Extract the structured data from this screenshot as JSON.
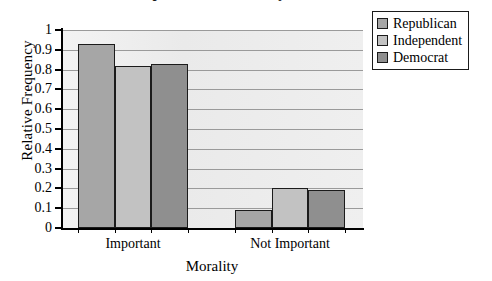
{
  "chart_data": {
    "type": "bar",
    "title": "Importance of Morality",
    "xlabel": "Morality",
    "ylabel": "Relative Frequency",
    "categories": [
      "Important",
      "Not Important"
    ],
    "series": [
      {
        "name": "Republican",
        "values": [
          0.93,
          0.09
        ],
        "color": "#a6a6a6"
      },
      {
        "name": "Independent",
        "values": [
          0.82,
          0.2
        ],
        "color": "#c2c2c2"
      },
      {
        "name": "Democrat",
        "values": [
          0.83,
          0.19
        ],
        "color": "#8f8f8f"
      }
    ],
    "ylim": [
      0,
      1
    ],
    "ytick_labels": [
      "1",
      "0.9",
      "0.8",
      "0.7",
      "0.6",
      "0.5",
      "0.4",
      "0.3",
      "0.2",
      "0.1",
      "0"
    ],
    "ytick_values": [
      1,
      0.9,
      0.8,
      0.7,
      0.6,
      0.5,
      0.4,
      0.3,
      0.2,
      0.1,
      0
    ],
    "grid": true,
    "legend_position": "top-right",
    "plot_background": "#ececec",
    "gridline_color": "#9a9a9a",
    "axis_color": "#000000"
  }
}
